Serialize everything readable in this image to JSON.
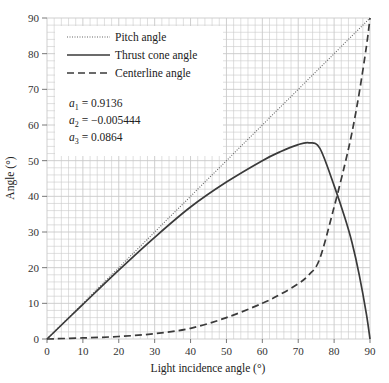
{
  "chart_data": {
    "type": "line",
    "title": "",
    "xlabel": "Light incidence angle (°)",
    "ylabel": "Angle (°)",
    "xlim": [
      0,
      90
    ],
    "ylim": [
      0,
      90
    ],
    "xticks": [
      0,
      10,
      20,
      30,
      40,
      50,
      60,
      70,
      80,
      90
    ],
    "yticks": [
      0,
      10,
      20,
      30,
      40,
      50,
      60,
      70,
      80,
      90
    ],
    "grid": true,
    "legend_position": "upper left",
    "series": [
      {
        "name": "Pitch angle",
        "style": "dotted",
        "x": [
          0,
          90
        ],
        "y": [
          0,
          90
        ]
      },
      {
        "name": "Thrust cone angle",
        "style": "solid",
        "x": [
          0,
          10,
          20,
          30,
          40,
          50,
          60,
          65,
          70,
          73,
          76,
          80,
          83,
          85,
          87,
          89,
          90
        ],
        "y": [
          0,
          9.7,
          19.3,
          28.5,
          37,
          44,
          50,
          52.5,
          54.5,
          55,
          53.5,
          43,
          34,
          27,
          18,
          7,
          0
        ]
      },
      {
        "name": "Centerline angle",
        "style": "dashed",
        "x": [
          0,
          10,
          20,
          30,
          40,
          50,
          60,
          65,
          70,
          73,
          76,
          80,
          83,
          85,
          87,
          89,
          90
        ],
        "y": [
          0,
          0.3,
          0.7,
          1.5,
          3,
          6,
          10,
          12.5,
          15.5,
          18,
          22.5,
          37,
          49,
          58,
          69,
          82,
          90
        ]
      }
    ],
    "annotations": [
      {
        "label": "a",
        "sub": "1",
        "value": "= 0.9136"
      },
      {
        "label": "a",
        "sub": "2",
        "value": "= −0.005444"
      },
      {
        "label": "a",
        "sub": "3",
        "value": "= 0.0864"
      }
    ]
  },
  "colors": {
    "grid": "#c9c9c9",
    "axis": "#555555",
    "line": "#3a3a3a"
  }
}
